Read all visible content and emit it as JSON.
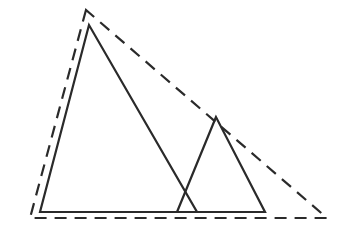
{
  "diagram": {
    "stroke_color": "#2a2a2a",
    "background": "#ffffff",
    "shapes": [
      {
        "name": "large-solid-triangle",
        "style": "solid",
        "points": [
          [
            89,
            25
          ],
          [
            40,
            212
          ],
          [
            197,
            212
          ]
        ]
      },
      {
        "name": "small-solid-triangle",
        "style": "solid",
        "points": [
          [
            216,
            117
          ],
          [
            177,
            212
          ],
          [
            265,
            212
          ]
        ]
      },
      {
        "name": "enclosing-dashed-triangle",
        "style": "dashed",
        "points": [
          [
            86,
            10
          ],
          [
            30,
            218
          ],
          [
            327,
            218
          ]
        ]
      }
    ],
    "shared_baseline": [
      [
        40,
        212
      ],
      [
        265,
        212
      ]
    ]
  }
}
